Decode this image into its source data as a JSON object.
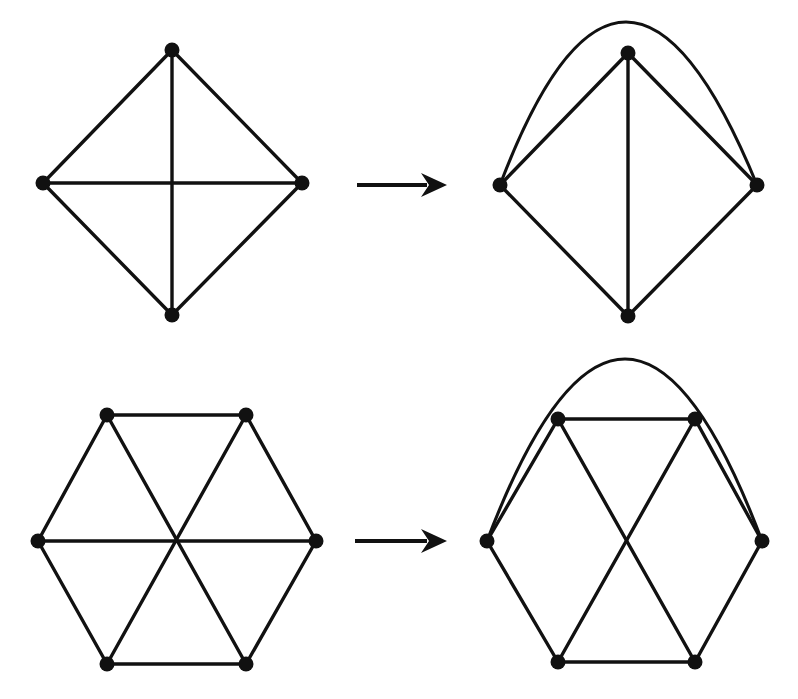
{
  "figure": {
    "background_color": "#ffffff",
    "stroke_color": "#111111",
    "vertex_color": "#111111",
    "vertex_radius": 7.5,
    "edge_width": 3.4
  },
  "rows": [
    {
      "name": "row-top",
      "left_figure": {
        "name": "diamond-graph-before",
        "shape": "diamond",
        "vertex_count": 4,
        "edge_count": 6,
        "vertices": [
          {
            "id": "t",
            "label": "top",
            "x": 172,
            "y": 50
          },
          {
            "id": "l",
            "label": "left",
            "x": 43,
            "y": 183
          },
          {
            "id": "r",
            "label": "right",
            "x": 302,
            "y": 183
          },
          {
            "id": "b",
            "label": "bottom",
            "x": 172,
            "y": 315
          }
        ],
        "edges": [
          {
            "from": "t",
            "to": "l",
            "kind": "straight"
          },
          {
            "from": "t",
            "to": "r",
            "kind": "straight"
          },
          {
            "from": "l",
            "to": "b",
            "kind": "straight"
          },
          {
            "from": "r",
            "to": "b",
            "kind": "straight"
          },
          {
            "from": "t",
            "to": "b",
            "kind": "straight"
          },
          {
            "from": "l",
            "to": "r",
            "kind": "straight"
          }
        ]
      },
      "arrow": {
        "name": "transform-arrow-top",
        "x1": 357,
        "y1": 185,
        "x2": 447,
        "y2": 185,
        "head_length": 26,
        "head_half_width": 12
      },
      "right_figure": {
        "name": "diamond-graph-after",
        "shape": "diamond-with-arc",
        "vertex_count": 4,
        "edge_count": 6,
        "vertices": [
          {
            "id": "t",
            "label": "top",
            "x": 628,
            "y": 53
          },
          {
            "id": "l",
            "label": "left",
            "x": 500,
            "y": 185
          },
          {
            "id": "r",
            "label": "right",
            "x": 757,
            "y": 185
          },
          {
            "id": "b",
            "label": "bottom",
            "x": 628,
            "y": 316
          }
        ],
        "edges": [
          {
            "from": "t",
            "to": "l",
            "kind": "straight"
          },
          {
            "from": "t",
            "to": "r",
            "kind": "straight"
          },
          {
            "from": "l",
            "to": "b",
            "kind": "straight"
          },
          {
            "from": "r",
            "to": "b",
            "kind": "straight"
          },
          {
            "from": "t",
            "to": "b",
            "kind": "straight"
          },
          {
            "from": "l",
            "to": "r",
            "kind": "arc",
            "arc_apex_x": 626,
            "arc_apex_y": 22
          }
        ]
      }
    },
    {
      "name": "row-bottom",
      "left_figure": {
        "name": "hexagon-graph-before",
        "shape": "hexagon",
        "vertex_count": 6,
        "edge_count": 9,
        "vertices": [
          {
            "id": "tl",
            "label": "top-left",
            "x": 107,
            "y": 415
          },
          {
            "id": "tr",
            "label": "top-right",
            "x": 246,
            "y": 415
          },
          {
            "id": "r",
            "label": "right",
            "x": 316,
            "y": 541
          },
          {
            "id": "br",
            "label": "bottom-right",
            "x": 246,
            "y": 664
          },
          {
            "id": "bl",
            "label": "bottom-left",
            "x": 107,
            "y": 664
          },
          {
            "id": "l",
            "label": "left",
            "x": 38,
            "y": 541
          }
        ],
        "edges": [
          {
            "from": "tl",
            "to": "tr",
            "kind": "straight"
          },
          {
            "from": "tr",
            "to": "r",
            "kind": "straight"
          },
          {
            "from": "r",
            "to": "br",
            "kind": "straight"
          },
          {
            "from": "br",
            "to": "bl",
            "kind": "straight"
          },
          {
            "from": "bl",
            "to": "l",
            "kind": "straight"
          },
          {
            "from": "l",
            "to": "tl",
            "kind": "straight"
          },
          {
            "from": "tl",
            "to": "br",
            "kind": "straight"
          },
          {
            "from": "tr",
            "to": "bl",
            "kind": "straight"
          },
          {
            "from": "l",
            "to": "r",
            "kind": "straight"
          }
        ]
      },
      "arrow": {
        "name": "transform-arrow-bottom",
        "x1": 355,
        "y1": 541,
        "x2": 447,
        "y2": 541,
        "head_length": 26,
        "head_half_width": 12
      },
      "right_figure": {
        "name": "hexagon-graph-after",
        "shape": "hexagon-with-arc",
        "vertex_count": 6,
        "edge_count": 9,
        "vertices": [
          {
            "id": "tl",
            "label": "top-left",
            "x": 558,
            "y": 419
          },
          {
            "id": "tr",
            "label": "top-right",
            "x": 695,
            "y": 419
          },
          {
            "id": "r",
            "label": "right",
            "x": 762,
            "y": 541
          },
          {
            "id": "br",
            "label": "bottom-right",
            "x": 695,
            "y": 662
          },
          {
            "id": "bl",
            "label": "bottom-left",
            "x": 558,
            "y": 662
          },
          {
            "id": "l",
            "label": "left",
            "x": 487,
            "y": 541
          }
        ],
        "edges": [
          {
            "from": "tl",
            "to": "tr",
            "kind": "straight"
          },
          {
            "from": "tr",
            "to": "r",
            "kind": "straight"
          },
          {
            "from": "r",
            "to": "br",
            "kind": "straight"
          },
          {
            "from": "br",
            "to": "bl",
            "kind": "straight"
          },
          {
            "from": "bl",
            "to": "l",
            "kind": "straight"
          },
          {
            "from": "l",
            "to": "tl",
            "kind": "straight"
          },
          {
            "from": "tl",
            "to": "br",
            "kind": "straight"
          },
          {
            "from": "tr",
            "to": "bl",
            "kind": "straight"
          },
          {
            "from": "l",
            "to": "r",
            "kind": "arc",
            "arc_apex_x": 625,
            "arc_apex_y": 359
          }
        ]
      }
    }
  ]
}
